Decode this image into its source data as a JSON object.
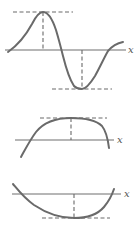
{
  "figure": {
    "panels": [
      {
        "id": "sine-like",
        "axis_label": "x",
        "features": [
          "local maximum with horizontal tangent",
          "local minimum with horizontal tangent"
        ]
      },
      {
        "id": "concave-down",
        "axis_label": "x",
        "features": [
          "maximum with horizontal tangent"
        ]
      },
      {
        "id": "concave-up",
        "axis_label": "x",
        "features": [
          "minimum with horizontal tangent"
        ]
      }
    ]
  },
  "colors": {
    "curve": "#6a6a6a",
    "axis": "#6e6e6e",
    "background": "#ffffff"
  }
}
